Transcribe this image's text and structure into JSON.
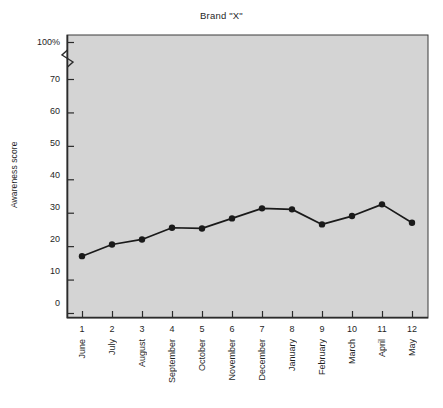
{
  "chart_data": {
    "type": "line",
    "title": "Brand \"X\"",
    "xlabel": "",
    "ylabel": "Awareness score",
    "categories": [
      "June",
      "July",
      "August",
      "September",
      "October",
      "November",
      "December",
      "January",
      "February",
      "March",
      "April",
      "May"
    ],
    "x": [
      1,
      2,
      3,
      4,
      5,
      6,
      7,
      8,
      9,
      10,
      11,
      12
    ],
    "x_tick_labels": [
      "1",
      "2",
      "3",
      "4",
      "5",
      "6",
      "7",
      "8",
      "9",
      "10",
      "11",
      "12"
    ],
    "values": [
      17,
      20.5,
      22,
      25.5,
      25.3,
      28.3,
      31.3,
      31,
      26.5,
      29,
      32.5,
      27
    ],
    "y_tick_labels": [
      "100%",
      "70",
      "60",
      "50",
      "40",
      "30",
      "20",
      "10",
      "0"
    ],
    "y_tick_values": [
      100,
      70,
      60,
      50,
      40,
      30,
      20,
      10,
      0
    ],
    "ylim": [
      0,
      100
    ],
    "axis_break": true,
    "axis_break_between": [
      70,
      100
    ],
    "grid": false,
    "legend": false,
    "legend_position": "none",
    "marker": "filled-circle",
    "line_color": "#1a1a1a",
    "marker_color": "#1a1a1a",
    "plot_background_color": "#d4d4d4",
    "axis_color": "#2b2b2b",
    "page_background_color": "#ffffff"
  },
  "figure": {
    "title": "Brand \"X\"",
    "y_axis_title": "Awareness score"
  }
}
